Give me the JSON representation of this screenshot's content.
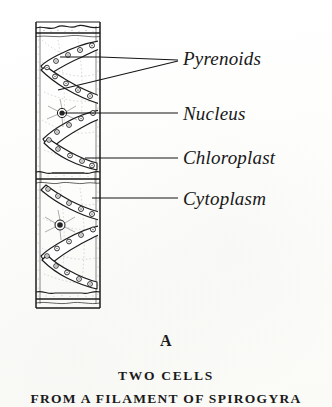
{
  "figure": {
    "panel_letter": "A",
    "caption_line_1": "TWO CELLS",
    "caption_line_2": "FROM A FILAMENT OF SPIROGYRA",
    "ink_color": "#181818",
    "paper_color": "#fdfdfc"
  },
  "labels": {
    "pyrenoids": "Pyrenoids",
    "nucleus": "Nucleus",
    "chloroplast": "Chloroplast",
    "cytoplasm": "Cytoplasm"
  },
  "diagram": {
    "organism": "Spirogyra",
    "cell_count": 2,
    "structures": [
      "cell-wall",
      "cross-wall-septum",
      "spiral-chloroplast",
      "pyrenoid",
      "nucleus",
      "cytoplasmic-strand"
    ]
  }
}
